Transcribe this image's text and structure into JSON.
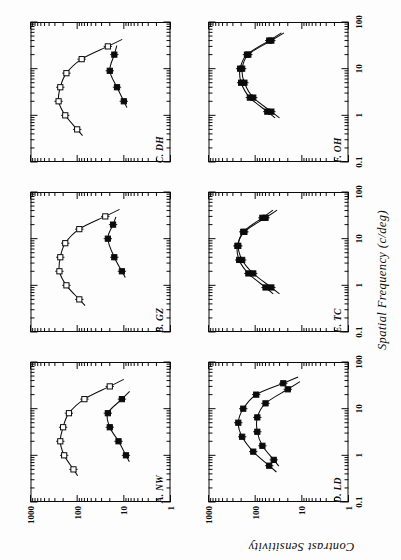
{
  "figure": {
    "orientation": "rotated-90-ccw",
    "background_color": "#fdfdfd",
    "ink_color": "#0b0b0b",
    "xaxis_title": "Spatial Frequency (c/deg)",
    "yaxis_title": "Contrast Sensitivity",
    "xtick_labels": [
      "0.1",
      "1",
      "10",
      "100"
    ],
    "ytick_labels": [
      "1000",
      "100",
      "10",
      "1"
    ],
    "panel_labels": [
      "A. NW",
      "B. GZ",
      "C. DH",
      "D. LD",
      "E. TC",
      "F. OH"
    ]
  },
  "chart_data": {
    "type": "line",
    "title": "",
    "subtitle": "",
    "xlabel": "Spatial Frequency (c/deg)",
    "ylabel": "Contrast Sensitivity",
    "xscale": "log",
    "yscale": "log",
    "xlim": [
      0.1,
      100
    ],
    "ylim": [
      1,
      1000
    ],
    "xticks": [
      0.1,
      1,
      10,
      100
    ],
    "yticks": [
      1,
      10,
      100,
      1000
    ],
    "grid": false,
    "legend": "none",
    "minor_ticks": "log-decade",
    "panels": [
      {
        "id": "A",
        "label": "A. NW",
        "row": 0,
        "col": 0,
        "series": [
          {
            "name": "open-symbols",
            "marker": "open-square",
            "x": [
              0.5,
              1.0,
              2.0,
              4.0,
              8.0,
              16.0,
              30.0
            ],
            "y": [
              120,
              190,
              230,
              200,
              150,
              70,
              20
            ]
          },
          {
            "name": "filled-symbols",
            "marker": "filled-square",
            "x": [
              1.0,
              2.0,
              4.0,
              8.0,
              16.0
            ],
            "y": [
              9,
              13,
              20,
              22,
              11
            ]
          }
        ]
      },
      {
        "id": "B",
        "label": "B. GZ",
        "row": 0,
        "col": 1,
        "series": [
          {
            "name": "open-symbols",
            "marker": "open-square",
            "x": [
              0.5,
              1.0,
              2.0,
              4.0,
              8.0,
              16.0,
              30.0
            ],
            "y": [
              90,
              170,
              240,
              230,
              180,
              90,
              25
            ]
          },
          {
            "name": "filled-symbols",
            "marker": "filled-square",
            "x": [
              2.0,
              4.0,
              10.0,
              20.0
            ],
            "y": [
              11,
              16,
              22,
              17
            ]
          }
        ]
      },
      {
        "id": "C",
        "label": "C. DH",
        "row": 0,
        "col": 2,
        "series": [
          {
            "name": "open-symbols",
            "marker": "open-square",
            "x": [
              0.5,
              1.0,
              2.0,
              4.0,
              8.0,
              16.0,
              30.0
            ],
            "y": [
              100,
              180,
              250,
              230,
              170,
              80,
              22
            ]
          },
          {
            "name": "filled-symbols",
            "marker": "filled-square",
            "x": [
              2.0,
              4.0,
              9.0,
              20.0
            ],
            "y": [
              10,
              14,
              20,
              16
            ]
          }
        ]
      },
      {
        "id": "D",
        "label": "D. LD",
        "row": 1,
        "col": 0,
        "series": [
          {
            "name": "open-symbols",
            "marker": "filled-square",
            "x": [
              0.6,
              1.2,
              2.5,
              5.0,
              10.0,
              20.0,
              35.0
            ],
            "y": [
              50,
              110,
              190,
              230,
              180,
              95,
              25
            ]
          },
          {
            "name": "filled-symbols",
            "marker": "filled-square",
            "x": [
              0.8,
              1.6,
              3.2,
              6.5,
              13.0,
              26.0
            ],
            "y": [
              40,
              70,
              90,
              90,
              60,
              20
            ]
          }
        ]
      },
      {
        "id": "E",
        "label": "E. TC",
        "row": 1,
        "col": 1,
        "series": [
          {
            "name": "open-symbols",
            "marker": "filled-square",
            "x": [
              0.9,
              1.8,
              3.5,
              7.0,
              14.0,
              28.0
            ],
            "y": [
              60,
              140,
              220,
              240,
              170,
              60
            ]
          },
          {
            "name": "filled-symbols",
            "marker": "filled-square",
            "x": [
              0.9,
              1.8,
              3.5,
              7.0,
              14.0,
              28.0
            ],
            "y": [
              45,
              110,
              190,
              230,
              180,
              70
            ]
          }
        ]
      },
      {
        "id": "F",
        "label": "F. OH",
        "row": 1,
        "col": 2,
        "series": [
          {
            "name": "open-symbols",
            "marker": "filled-square",
            "x": [
              1.2,
              2.4,
              5.0,
              10.0,
              20.0,
              40.0
            ],
            "y": [
              55,
              130,
              200,
              210,
              150,
              50
            ]
          },
          {
            "name": "filled-symbols",
            "marker": "filled-square",
            "x": [
              1.2,
              2.4,
              5.0,
              10.0,
              20.0,
              40.0
            ],
            "y": [
              45,
              110,
              170,
              190,
              140,
              45
            ]
          }
        ]
      }
    ]
  }
}
